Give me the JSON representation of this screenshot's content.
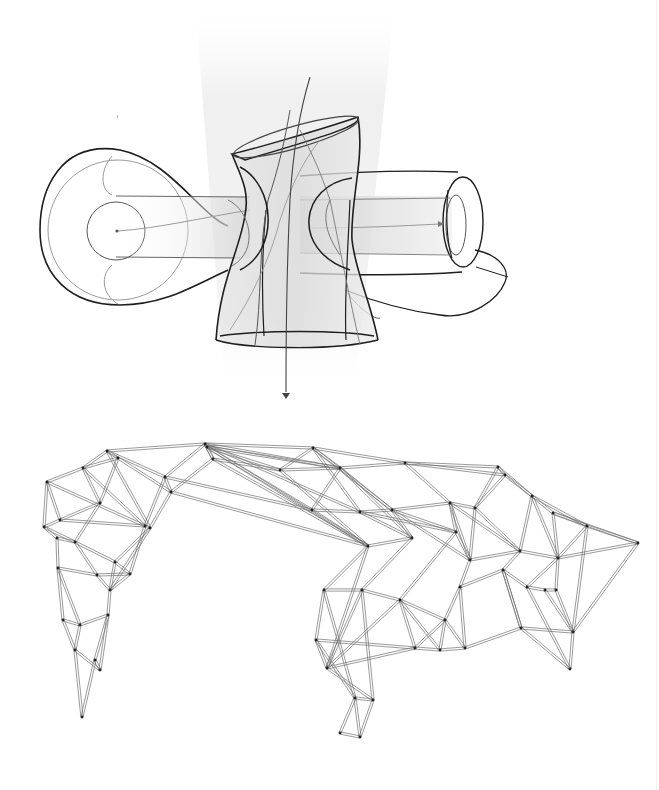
{
  "figure": {
    "type": "architectural-diagram",
    "panels": [
      "surface-study",
      "space-frame-wireframe"
    ],
    "colors": {
      "background": "#ffffff",
      "stroke_dark": "#1e1e1e",
      "stroke_mid": "#555555",
      "stroke_light": "#9a9a9a",
      "shade": "#d8d8d8",
      "strut": "#6e6e6e",
      "node": "#222222"
    }
  },
  "top": {
    "light_cone": {
      "points": [
        [
          195,
          0
        ],
        [
          395,
          0
        ],
        [
          355,
          390
        ],
        [
          225,
          390
        ]
      ]
    },
    "arrow": {
      "x": 286,
      "y1": 380,
      "y2": 398
    },
    "left_bulb": {
      "cx": 118,
      "cy": 230,
      "r_outer": 78,
      "r_inner": 30
    },
    "right_ring": {
      "cx": 462,
      "cy": 225,
      "rx": 22,
      "ry": 44
    }
  },
  "wireframe": {
    "nodes": [
      [
        107,
        451
      ],
      [
        205,
        444
      ],
      [
        207,
        447
      ],
      [
        313,
        448
      ],
      [
        405,
        463
      ],
      [
        498,
        467
      ],
      [
        47,
        482
      ],
      [
        83,
        468
      ],
      [
        118,
        458
      ],
      [
        165,
        477
      ],
      [
        213,
        459
      ],
      [
        280,
        470
      ],
      [
        340,
        468
      ],
      [
        44,
        527
      ],
      [
        60,
        520
      ],
      [
        100,
        503
      ],
      [
        145,
        526
      ],
      [
        171,
        492
      ],
      [
        57,
        538
      ],
      [
        75,
        542
      ],
      [
        115,
        562
      ],
      [
        130,
        574
      ],
      [
        150,
        528
      ],
      [
        58,
        568
      ],
      [
        97,
        575
      ],
      [
        110,
        590
      ],
      [
        108,
        615
      ],
      [
        80,
        625
      ],
      [
        63,
        620
      ],
      [
        75,
        650
      ],
      [
        82,
        717
      ],
      [
        100,
        670
      ],
      [
        95,
        660
      ],
      [
        312,
        510
      ],
      [
        360,
        512
      ],
      [
        392,
        510
      ],
      [
        450,
        503
      ],
      [
        475,
        508
      ],
      [
        505,
        475
      ],
      [
        532,
        496
      ],
      [
        553,
        513
      ],
      [
        368,
        546
      ],
      [
        412,
        538
      ],
      [
        456,
        532
      ],
      [
        470,
        560
      ],
      [
        520,
        551
      ],
      [
        558,
        558
      ],
      [
        587,
        526
      ],
      [
        638,
        543
      ],
      [
        324,
        590
      ],
      [
        362,
        590
      ],
      [
        400,
        600
      ],
      [
        445,
        620
      ],
      [
        460,
        587
      ],
      [
        503,
        570
      ],
      [
        527,
        587
      ],
      [
        545,
        590
      ],
      [
        556,
        590
      ],
      [
        573,
        632
      ],
      [
        570,
        669
      ],
      [
        316,
        640
      ],
      [
        327,
        668
      ],
      [
        360,
        737
      ],
      [
        355,
        698
      ],
      [
        373,
        700
      ],
      [
        340,
        733
      ],
      [
        415,
        648
      ],
      [
        440,
        650
      ],
      [
        465,
        648
      ],
      [
        521,
        628
      ]
    ],
    "edges": [
      [
        0,
        1
      ],
      [
        1,
        2
      ],
      [
        1,
        3
      ],
      [
        3,
        4
      ],
      [
        4,
        5
      ],
      [
        0,
        7
      ],
      [
        7,
        6
      ],
      [
        6,
        13
      ],
      [
        7,
        8
      ],
      [
        8,
        0
      ],
      [
        0,
        9
      ],
      [
        9,
        1
      ],
      [
        1,
        10
      ],
      [
        10,
        2
      ],
      [
        2,
        11
      ],
      [
        11,
        3
      ],
      [
        3,
        12
      ],
      [
        12,
        4
      ],
      [
        4,
        38
      ],
      [
        38,
        5
      ],
      [
        6,
        14
      ],
      [
        14,
        15
      ],
      [
        15,
        7
      ],
      [
        15,
        8
      ],
      [
        8,
        17
      ],
      [
        17,
        9
      ],
      [
        9,
        16
      ],
      [
        16,
        22
      ],
      [
        22,
        0
      ],
      [
        17,
        10
      ],
      [
        10,
        11
      ],
      [
        11,
        12
      ],
      [
        12,
        33
      ],
      [
        33,
        34
      ],
      [
        34,
        35
      ],
      [
        35,
        36
      ],
      [
        36,
        37
      ],
      [
        37,
        38
      ],
      [
        38,
        39
      ],
      [
        39,
        40
      ],
      [
        40,
        47
      ],
      [
        47,
        48
      ],
      [
        48,
        46
      ],
      [
        13,
        14
      ],
      [
        13,
        18
      ],
      [
        18,
        19
      ],
      [
        19,
        15
      ],
      [
        19,
        20
      ],
      [
        20,
        22
      ],
      [
        22,
        17
      ],
      [
        14,
        16
      ],
      [
        16,
        21
      ],
      [
        21,
        20
      ],
      [
        18,
        23
      ],
      [
        23,
        24
      ],
      [
        24,
        19
      ],
      [
        24,
        25
      ],
      [
        25,
        20
      ],
      [
        25,
        26
      ],
      [
        26,
        27
      ],
      [
        27,
        23
      ],
      [
        23,
        28
      ],
      [
        28,
        27
      ],
      [
        27,
        29
      ],
      [
        29,
        31
      ],
      [
        31,
        26
      ],
      [
        29,
        30
      ],
      [
        30,
        32
      ],
      [
        32,
        31
      ],
      [
        28,
        29
      ],
      [
        21,
        24
      ],
      [
        21,
        25
      ],
      [
        13,
        19
      ],
      [
        6,
        16
      ],
      [
        7,
        16
      ],
      [
        22,
        25
      ],
      [
        26,
        32
      ],
      [
        1,
        12
      ],
      [
        2,
        33
      ],
      [
        3,
        34
      ],
      [
        1,
        34
      ],
      [
        2,
        41
      ],
      [
        33,
        41
      ],
      [
        41,
        42
      ],
      [
        42,
        34
      ],
      [
        42,
        35
      ],
      [
        35,
        43
      ],
      [
        43,
        36
      ],
      [
        36,
        44
      ],
      [
        44,
        37
      ],
      [
        37,
        45
      ],
      [
        45,
        39
      ],
      [
        39,
        46
      ],
      [
        46,
        40
      ],
      [
        46,
        47
      ],
      [
        45,
        46
      ],
      [
        44,
        45
      ],
      [
        43,
        44
      ],
      [
        41,
        49
      ],
      [
        49,
        50
      ],
      [
        50,
        42
      ],
      [
        50,
        51
      ],
      [
        51,
        43
      ],
      [
        51,
        52
      ],
      [
        52,
        53
      ],
      [
        53,
        44
      ],
      [
        53,
        54
      ],
      [
        54,
        45
      ],
      [
        54,
        55
      ],
      [
        55,
        46
      ],
      [
        55,
        56
      ],
      [
        56,
        57
      ],
      [
        57,
        46
      ],
      [
        57,
        58
      ],
      [
        58,
        48
      ],
      [
        58,
        59
      ],
      [
        56,
        58
      ],
      [
        59,
        55
      ],
      [
        47,
        58
      ],
      [
        49,
        60
      ],
      [
        60,
        61
      ],
      [
        61,
        50
      ],
      [
        60,
        63
      ],
      [
        63,
        62
      ],
      [
        62,
        65
      ],
      [
        65,
        63
      ],
      [
        63,
        64
      ],
      [
        64,
        62
      ],
      [
        61,
        64
      ],
      [
        61,
        51
      ],
      [
        50,
        64
      ],
      [
        49,
        63
      ],
      [
        41,
        61
      ],
      [
        60,
        66
      ],
      [
        66,
        67
      ],
      [
        67,
        68
      ],
      [
        68,
        69
      ],
      [
        69,
        59
      ],
      [
        66,
        51
      ],
      [
        66,
        52
      ],
      [
        67,
        52
      ],
      [
        68,
        53
      ],
      [
        69,
        54
      ],
      [
        69,
        58
      ],
      [
        61,
        66
      ],
      [
        51,
        67
      ],
      [
        52,
        68
      ],
      [
        54,
        69
      ],
      [
        11,
        41
      ],
      [
        12,
        42
      ],
      [
        10,
        41
      ],
      [
        9,
        33
      ],
      [
        17,
        41
      ],
      [
        34,
        43
      ],
      [
        35,
        44
      ],
      [
        36,
        45
      ],
      [
        4,
        36
      ],
      [
        5,
        37
      ],
      [
        5,
        39
      ],
      [
        40,
        48
      ],
      [
        39,
        47
      ],
      [
        12,
        35
      ],
      [
        3,
        35
      ],
      [
        2,
        12
      ]
    ]
  }
}
